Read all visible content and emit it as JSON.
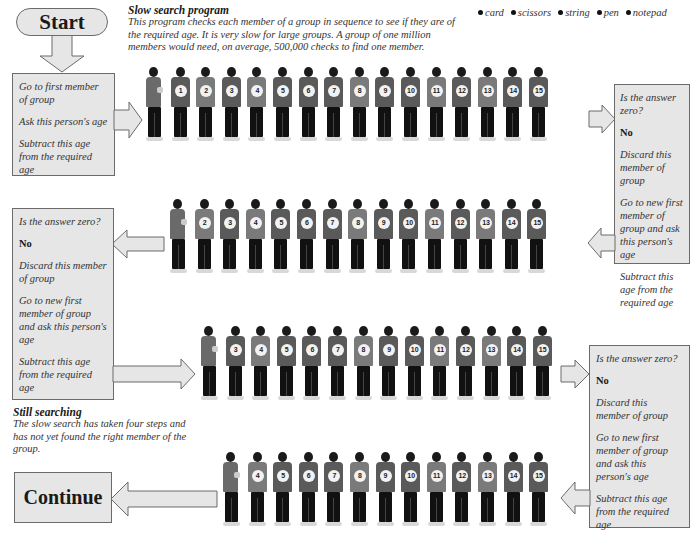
{
  "header": {
    "title": "Slow search program",
    "description": "This program checks each member of a group in sequence to see if they are of the required age. It is very slow for large groups. A group of one million members would need, on average, 500,000 checks to find one member."
  },
  "legend": {
    "items": [
      "card",
      "scissors",
      "string",
      "pen",
      "notepad"
    ]
  },
  "start_button": {
    "label": "Start"
  },
  "continue_button": {
    "label": "Continue"
  },
  "step1_box": {
    "lines": [
      "Go to first member of group",
      "Ask this person's age",
      "Subtract this age from the required age"
    ]
  },
  "step2_box": {
    "lines": [
      "Is the answer zero?",
      "No",
      "Discard this member of group",
      "Go to new first member of group and ask this person's age",
      "Subtract this age from the required age"
    ]
  },
  "step3_box": {
    "lines": [
      "Is the answer zero?",
      "No",
      "Discard this member of group",
      "Go to new first member of group and ask this person's age",
      "Subtract this age from the required age"
    ]
  },
  "step4_box": {
    "lines": [
      "Is the answer zero?",
      "No",
      "Discard this member of group",
      "Go to new first member of group and ask this person's age",
      "Subtract this age from the required age"
    ]
  },
  "status": {
    "title": "Still searching",
    "description": "The slow search has taken four steps and has not yet found the right member of the group."
  },
  "rows": [
    {
      "members": [
        "1",
        "2",
        "3",
        "4",
        "5",
        "6",
        "7",
        "8",
        "9",
        "10",
        "11",
        "12",
        "13",
        "14",
        "15"
      ]
    },
    {
      "members": [
        "2",
        "3",
        "4",
        "5",
        "6",
        "7",
        "8",
        "9",
        "10",
        "11",
        "12",
        "13",
        "14",
        "15"
      ]
    },
    {
      "members": [
        "3",
        "4",
        "5",
        "6",
        "7",
        "8",
        "9",
        "10",
        "11",
        "12",
        "13",
        "14",
        "15"
      ]
    },
    {
      "members": [
        "4",
        "5",
        "6",
        "7",
        "8",
        "9",
        "10",
        "11",
        "12",
        "13",
        "14",
        "15"
      ]
    }
  ],
  "colors": {
    "box_fill": "#e6e6e6",
    "box_border": "#6b6b6b",
    "text": "#333333"
  }
}
